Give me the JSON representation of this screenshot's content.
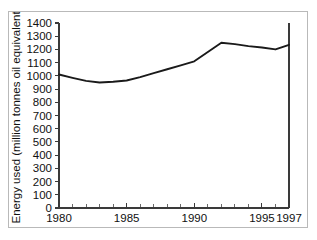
{
  "figure": {
    "title_fragment": "",
    "border_color": "#b9b9b9",
    "background": "#ffffff",
    "line_color": "#1a1a1a",
    "axis_color": "#3a3a3a"
  },
  "chart_data": {
    "type": "line",
    "title": "",
    "xlabel": "",
    "ylabel": "Energy used  (million tonnes oil equivalent)",
    "xlim": [
      1980,
      1997
    ],
    "ylim": [
      0,
      1400
    ],
    "grid": false,
    "legend": "none",
    "yticks": [
      0,
      100,
      200,
      300,
      400,
      500,
      600,
      700,
      800,
      900,
      1000,
      1100,
      1200,
      1300,
      1400
    ],
    "ytick_labels": [
      "0",
      "100",
      "200",
      "300",
      "400",
      "500",
      "600",
      "700",
      "800",
      "900",
      "1000",
      "1100",
      "1200",
      "1300",
      "1400"
    ],
    "xticks": [
      1980,
      1985,
      1990,
      1995,
      1997
    ],
    "xtick_labels": [
      "1980",
      "1985",
      "1990",
      "1995",
      "1997"
    ],
    "x_minor_ticks": [
      1981,
      1982,
      1983,
      1984,
      1986,
      1987,
      1988,
      1989,
      1991,
      1992,
      1993,
      1994,
      1996
    ],
    "series": [
      {
        "name": "Energy used",
        "x": [
          1980,
          1981,
          1982,
          1983,
          1984,
          1985,
          1986,
          1987,
          1988,
          1989,
          1990,
          1991,
          1992,
          1993,
          1994,
          1995,
          1996,
          1997
        ],
        "values": [
          1010,
          985,
          962,
          950,
          955,
          965,
          990,
          1020,
          1050,
          1080,
          1110,
          1180,
          1250,
          1240,
          1225,
          1215,
          1200,
          1235
        ]
      }
    ]
  }
}
